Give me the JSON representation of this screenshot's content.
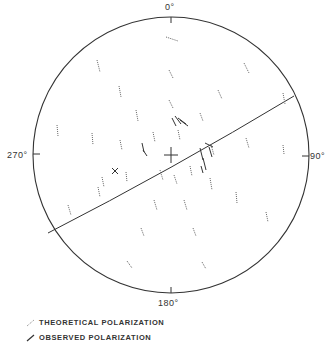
{
  "diagram": {
    "type": "polar-stereographic",
    "axis_labels": {
      "top": "0°",
      "right": "90°",
      "bottom": "180°",
      "left": "270°"
    },
    "circle": {
      "cx": 171,
      "cy": 155,
      "r": 138
    },
    "great_circle": {
      "from": [
        48,
        233
      ],
      "to": [
        294,
        96
      ]
    },
    "center_cross": {
      "x": 171,
      "y": 155
    },
    "theoretical_segments": [
      [
        166,
        37,
        178,
        41
      ],
      [
        97,
        60,
        100,
        72
      ],
      [
        244,
        63,
        249,
        73
      ],
      [
        169,
        70,
        173,
        78
      ],
      [
        119,
        86,
        121,
        97
      ],
      [
        218,
        90,
        222,
        99
      ],
      [
        169,
        100,
        173,
        108
      ],
      [
        283,
        93,
        285,
        104
      ],
      [
        136,
        110,
        138,
        121
      ],
      [
        200,
        113,
        203,
        121
      ],
      [
        57,
        125,
        58,
        136
      ],
      [
        92,
        133,
        93,
        145
      ],
      [
        120,
        140,
        122,
        150
      ],
      [
        153,
        132,
        155,
        142
      ],
      [
        178,
        130,
        180,
        140
      ],
      [
        211,
        145,
        214,
        155
      ],
      [
        246,
        138,
        249,
        148
      ],
      [
        283,
        145,
        284,
        154
      ],
      [
        102,
        177,
        104,
        187
      ],
      [
        126,
        172,
        127,
        182
      ],
      [
        160,
        170,
        163,
        180
      ],
      [
        174,
        175,
        177,
        184
      ],
      [
        190,
        166,
        192,
        176
      ],
      [
        210,
        178,
        212,
        190
      ],
      [
        68,
        205,
        71,
        215
      ],
      [
        98,
        187,
        100,
        197
      ],
      [
        154,
        200,
        157,
        210
      ],
      [
        184,
        200,
        187,
        210
      ],
      [
        236,
        192,
        237,
        203
      ],
      [
        266,
        212,
        268,
        222
      ],
      [
        141,
        228,
        144,
        236
      ],
      [
        193,
        228,
        196,
        236
      ],
      [
        127,
        261,
        132,
        268
      ],
      [
        202,
        262,
        206,
        269
      ]
    ],
    "observed_segments": [
      [
        172,
        118,
        176,
        126
      ],
      [
        175,
        116,
        181,
        124
      ],
      [
        178,
        118,
        186,
        124
      ],
      [
        180,
        120,
        188,
        126
      ],
      [
        142,
        143,
        144,
        152
      ],
      [
        143,
        150,
        147,
        156
      ],
      [
        112,
        168,
        118,
        174
      ],
      [
        112,
        174,
        118,
        168
      ],
      [
        200,
        148,
        203,
        160
      ],
      [
        203,
        158,
        206,
        170
      ],
      [
        201,
        166,
        203,
        173
      ],
      [
        205,
        143,
        213,
        147
      ],
      [
        209,
        147,
        212,
        157
      ]
    ]
  },
  "legend": {
    "items": [
      {
        "label": "THEORETICAL POLARIZATION",
        "style": "dotted"
      },
      {
        "label": "OBSERVED POLARIZATION",
        "style": "solid"
      }
    ]
  }
}
